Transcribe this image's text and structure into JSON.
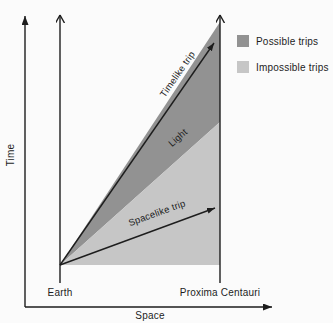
{
  "diagram": {
    "axes": {
      "y_label": "Time",
      "x_label": "Space"
    },
    "locations": {
      "origin": "Earth",
      "destination": "Proxima Centauri"
    },
    "trips": {
      "timelike": "Timelike trip",
      "light": "Light",
      "spacelike": "Spacelike trip"
    },
    "legend": {
      "possible": {
        "label": "Possible trips",
        "color": "#929292"
      },
      "impossible": {
        "label": "Impossible trips",
        "color": "#c6c6c6"
      }
    },
    "ink_color": "#1d1d1d",
    "background_color": "#fbfbfb"
  }
}
